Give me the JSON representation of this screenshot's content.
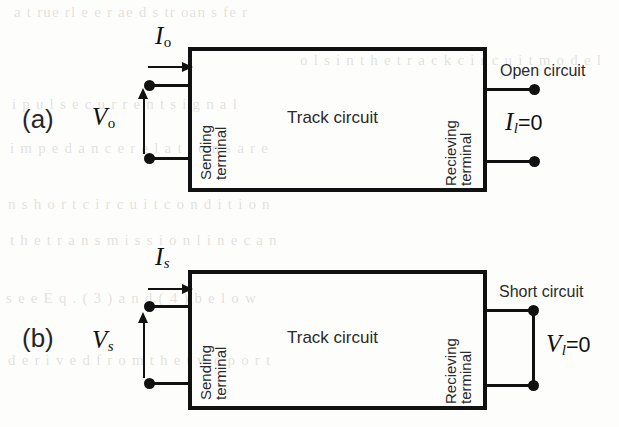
{
  "figure": {
    "background_color": "#fdfdfb",
    "ink_color": "#111111",
    "bleed_text": [
      "a t rue rl e e r ae d s tr oan s fe r",
      "o l s i n t h e t r a c k  c i r c u i t  m o d e l",
      "i p u l s e    c u r r e n t    s i g n a l",
      "i m p e d a n c e   r e l a t i o n s   a r e",
      "n   s h o r t  c i r c u i t  c o n d i t i o n",
      "t h e  t r a n s m i s s i o n  l i n e  c a n",
      "s e e  E q .  ( 3 )  a n d  ( 4 )  b e l o w",
      "d e r i v e d  f r o m  t h e  t w o  p o r t"
    ]
  },
  "panels": [
    {
      "letter": "(a)",
      "box_label": "Track circuit",
      "sending_terminal": {
        "line1": "Sending",
        "line2": "terminal"
      },
      "receiving_terminal": {
        "line1": "Recieving",
        "line2": "terminal"
      },
      "current_symbol": {
        "base": "I",
        "sub": "o"
      },
      "voltage_symbol": {
        "base": "V",
        "sub": "o"
      },
      "load_condition_label": "Open circuit",
      "load_symbol": {
        "base": "I",
        "sub": "l",
        "equals": "=0"
      }
    },
    {
      "letter": "(b)",
      "box_label": "Track circuit",
      "sending_terminal": {
        "line1": "Sending",
        "line2": "terminal"
      },
      "receiving_terminal": {
        "line1": "Recieving",
        "line2": "terminal"
      },
      "current_symbol": {
        "base": "I",
        "sub": "s"
      },
      "voltage_symbol": {
        "base": "V",
        "sub": "s"
      },
      "load_condition_label": "Short circuit",
      "load_symbol": {
        "base": "V",
        "sub": "l",
        "equals": "=0"
      }
    }
  ]
}
